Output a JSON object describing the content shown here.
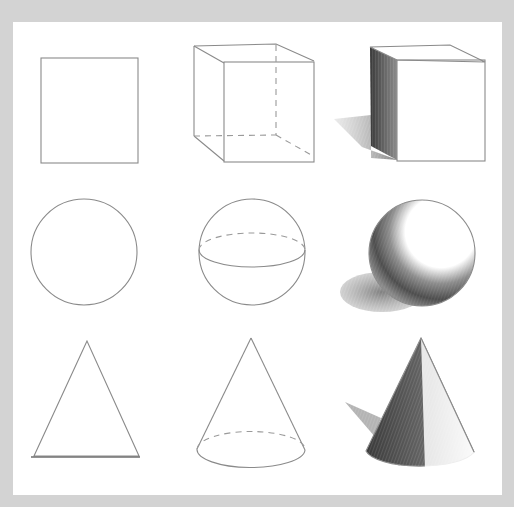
{
  "grid": {
    "rows": [
      {
        "shape": "cube",
        "cells": [
          {
            "stage": "outline",
            "label": "square"
          },
          {
            "stage": "construction",
            "label": "wireframe cube"
          },
          {
            "stage": "shaded",
            "label": "shaded cube with cast shadow"
          }
        ]
      },
      {
        "shape": "sphere",
        "cells": [
          {
            "stage": "outline",
            "label": "circle"
          },
          {
            "stage": "construction",
            "label": "sphere with equator"
          },
          {
            "stage": "shaded",
            "label": "shaded sphere with cast shadow"
          }
        ]
      },
      {
        "shape": "cone",
        "cells": [
          {
            "stage": "outline",
            "label": "triangle"
          },
          {
            "stage": "construction",
            "label": "cone with elliptical base"
          },
          {
            "stage": "shaded",
            "label": "shaded cone with cast shadow"
          }
        ]
      }
    ]
  },
  "colors": {
    "background": "#d3d3d3",
    "paper": "#ffffff",
    "pencil": "#8a8a8a",
    "shade_dark": "#4a4a4a"
  }
}
